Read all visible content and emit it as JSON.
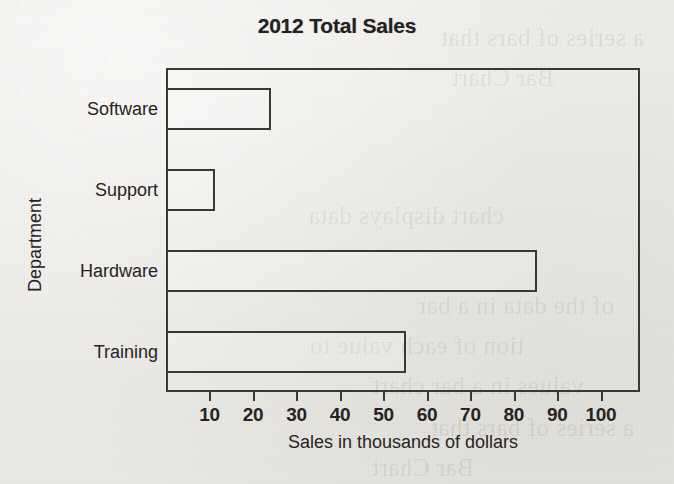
{
  "chart_data": {
    "type": "bar",
    "orientation": "horizontal",
    "title": "2012 Total Sales",
    "categories": [
      "Software",
      "Support",
      "Hardware",
      "Training"
    ],
    "values": [
      24,
      11,
      85,
      55
    ],
    "xlabel": "Sales in thousands of dollars",
    "ylabel": "Department",
    "xlim": [
      0,
      109
    ],
    "xticks": [
      10,
      20,
      30,
      40,
      50,
      60,
      70,
      80,
      90,
      100
    ],
    "xtick_labels": [
      "10",
      "20",
      "30",
      "40",
      "50",
      "60",
      "70",
      "80",
      "90",
      "100"
    ],
    "grid": false,
    "legend": false,
    "bar_style": {
      "fill": "none",
      "edge_color": "#3a3832"
    }
  },
  "page": {
    "background_color": "#eeedea",
    "ink_color": "#26241f",
    "bleed_lines": [
      "a series of bars that",
      "Bar Chart",
      "chart displays data",
      "of the data in a bar",
      "tion of each value to",
      "values in a bar chart"
    ]
  }
}
